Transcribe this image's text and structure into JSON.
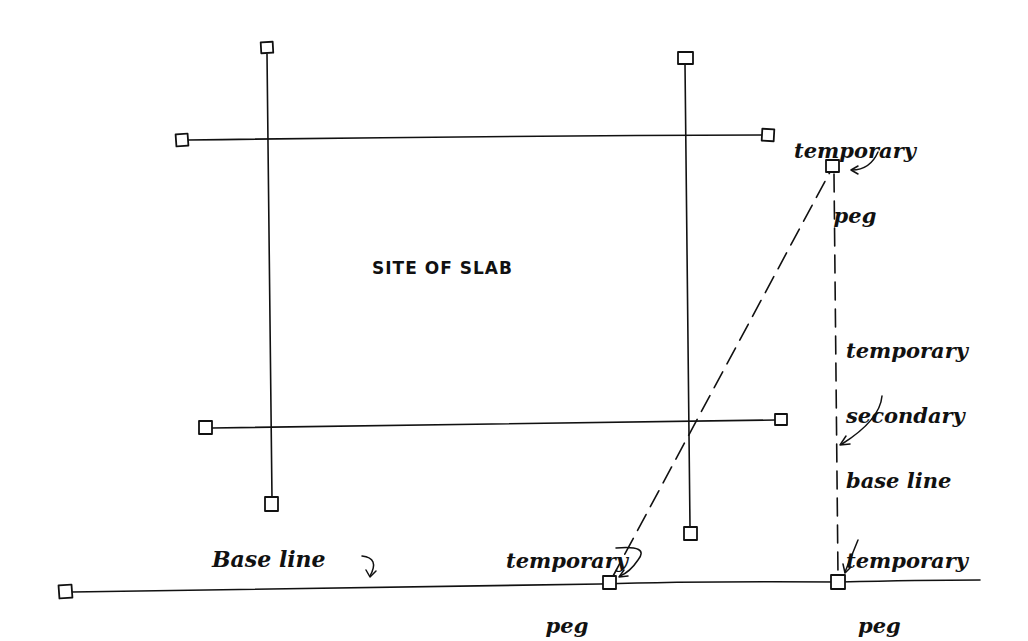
{
  "diagram": {
    "ink_color": "#111111",
    "background": "#ffffff",
    "labels": {
      "site": "SITE OF SLAB",
      "peg_top_right_line1": "temporary",
      "peg_top_right_line2": "peg",
      "secondary_line1": "temporary",
      "secondary_line2": "secondary",
      "secondary_line3": "base line",
      "peg_bottom_mid_line1": "temporary",
      "peg_bottom_mid_line2": "peg",
      "peg_bottom_right_line1": "temporary",
      "peg_bottom_right_line2": "peg",
      "base_line": "Base line"
    },
    "grid_lines": [
      {
        "name": "top-horizontal",
        "x1": 183,
        "y1": 140,
        "x2": 768,
        "y2": 135
      },
      {
        "name": "bottom-horizontal",
        "x1": 206,
        "y1": 428,
        "x2": 780,
        "y2": 420
      },
      {
        "name": "left-vertical",
        "x1": 267,
        "y1": 48,
        "x2": 272,
        "y2": 505
      },
      {
        "name": "right-vertical",
        "x1": 685,
        "y1": 58,
        "x2": 690,
        "y2": 533
      }
    ],
    "base_line": {
      "x1": 66,
      "y1": 592,
      "x2": 980,
      "y2": 580
    },
    "dashed_lines": [
      {
        "name": "diagonal-to-peg",
        "x1": 610,
        "y1": 582,
        "x2": 832,
        "y2": 166
      },
      {
        "name": "secondary-base-line",
        "x1": 834,
        "y1": 166,
        "x2": 838,
        "y2": 582
      }
    ],
    "pegs": [
      {
        "name": "peg-top-left-vertical",
        "x": 267,
        "y": 48
      },
      {
        "name": "peg-top-right-vertical",
        "x": 685,
        "y": 58
      },
      {
        "name": "peg-left-top-horizontal",
        "x": 182,
        "y": 140
      },
      {
        "name": "peg-right-top-horizontal",
        "x": 768,
        "y": 135
      },
      {
        "name": "peg-left-bottom-horizontal",
        "x": 206,
        "y": 428
      },
      {
        "name": "peg-right-bottom-horizontal",
        "x": 781,
        "y": 420
      },
      {
        "name": "peg-bottom-left-vertical",
        "x": 272,
        "y": 505
      },
      {
        "name": "peg-bottom-right-vertical",
        "x": 690,
        "y": 533
      },
      {
        "name": "peg-base-line-start",
        "x": 66,
        "y": 592
      },
      {
        "name": "peg-temporary-top",
        "x": 832,
        "y": 166
      },
      {
        "name": "peg-temporary-bottom-mid",
        "x": 610,
        "y": 582
      },
      {
        "name": "peg-temporary-bottom-right",
        "x": 838,
        "y": 582
      }
    ]
  }
}
